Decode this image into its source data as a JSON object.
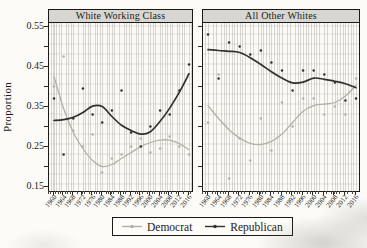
{
  "figure": {
    "y_axis_title": "Proportion",
    "y_ticks": [
      "0.55",
      "0.45",
      "0.35",
      "0.25",
      "0.15"
    ],
    "x_tick_years": [
      "1960",
      "1964",
      "1968",
      "1972",
      "1976",
      "1980",
      "1984",
      "1988",
      "1992",
      "1996",
      "2000",
      "2004",
      "2008",
      "2012",
      "2016"
    ],
    "legend": {
      "items": [
        {
          "label": "Democrat",
          "color": "#b2b1a8"
        },
        {
          "label": "Republican",
          "color": "#33312e"
        }
      ]
    }
  },
  "chart_data": {
    "type": "scatter",
    "subtype": "scatter points with loess smoothed lines, two faceted panels",
    "x": [
      1960,
      1964,
      1968,
      1972,
      1976,
      1980,
      1984,
      1988,
      1992,
      1996,
      2000,
      2004,
      2008,
      2012,
      2016
    ],
    "xlabel": "",
    "ylabel": "Proportion",
    "ylim": [
      0.15,
      0.55
    ],
    "y_tick_step": 0.1,
    "grid": "fine vertical yearly lines plus faint horizontal lines",
    "legend_position": "bottom-center",
    "panels": [
      {
        "title": "White Working Class",
        "series": [
          {
            "name": "Democrat",
            "color": "#b2b1a8",
            "smooth": [
              0.425,
              0.345,
              0.285,
              0.245,
              0.215,
              0.2,
              0.205,
              0.22,
              0.235,
              0.25,
              0.26,
              0.266,
              0.266,
              0.257,
              0.242
            ],
            "points": [
              0.4,
              0.475,
              0.29,
              0.25,
              0.28,
              0.185,
              0.22,
              0.23,
              0.25,
              0.27,
              0.235,
              0.245,
              0.275,
              0.25,
              0.23
            ]
          },
          {
            "name": "Republican",
            "color": "#33312e",
            "smooth": [
              0.315,
              0.317,
              0.323,
              0.335,
              0.351,
              0.35,
              0.325,
              0.303,
              0.29,
              0.281,
              0.287,
              0.313,
              0.346,
              0.386,
              0.432
            ],
            "points": [
              0.37,
              0.23,
              0.32,
              0.395,
              0.33,
              0.31,
              0.34,
              0.39,
              0.285,
              0.25,
              0.3,
              0.34,
              0.33,
              0.39,
              0.455
            ]
          }
        ]
      },
      {
        "title": "All Other Whites",
        "series": [
          {
            "name": "Democrat",
            "color": "#b2b1a8",
            "smooth": [
              0.352,
              0.32,
              0.292,
              0.271,
              0.258,
              0.255,
              0.263,
              0.281,
              0.31,
              0.338,
              0.352,
              0.356,
              0.36,
              0.376,
              0.403
            ],
            "points": [
              0.31,
              0.43,
              0.17,
              0.27,
              0.215,
              0.32,
              0.24,
              0.36,
              0.3,
              0.37,
              0.37,
              0.33,
              0.35,
              0.33,
              0.42
            ]
          },
          {
            "name": "Republican",
            "color": "#33312e",
            "smooth": [
              0.492,
              0.49,
              0.488,
              0.485,
              0.472,
              0.455,
              0.437,
              0.421,
              0.409,
              0.411,
              0.421,
              0.418,
              0.413,
              0.407,
              0.397
            ],
            "points": [
              0.53,
              0.42,
              0.51,
              0.5,
              0.48,
              0.49,
              0.46,
              0.44,
              0.39,
              0.44,
              0.44,
              0.43,
              0.41,
              0.365,
              0.37
            ]
          }
        ]
      }
    ]
  }
}
